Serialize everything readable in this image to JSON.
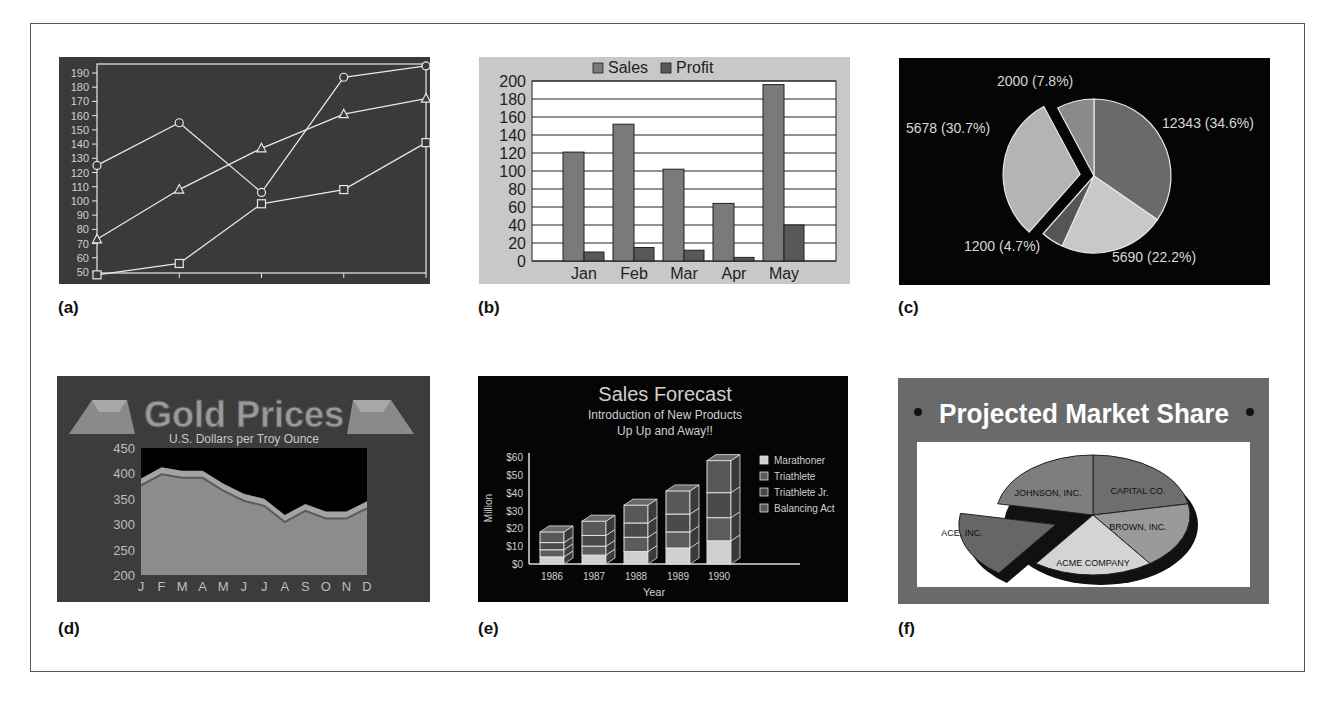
{
  "figure": {
    "panel_labels": [
      "(a)",
      "(b)",
      "(c)",
      "(d)",
      "(e)",
      "(f)"
    ]
  },
  "chart_data": [
    {
      "id": "a",
      "type": "line",
      "title": "",
      "xlabel": "",
      "ylabel": "",
      "x": [
        1,
        2,
        3,
        4,
        5
      ],
      "ylim": [
        50,
        190
      ],
      "yticks": [
        50,
        60,
        70,
        80,
        90,
        100,
        110,
        120,
        130,
        140,
        150,
        160,
        170,
        180,
        190
      ],
      "series": [
        {
          "name": "circle-series",
          "marker": "circle",
          "values": [
            125,
            155,
            106,
            187,
            195
          ]
        },
        {
          "name": "triangle-series",
          "marker": "triangle",
          "values": [
            73,
            108,
            137,
            161,
            172
          ]
        },
        {
          "name": "square-series",
          "marker": "square",
          "values": [
            48,
            56,
            98,
            108,
            141
          ]
        }
      ],
      "grid": false,
      "colors": {
        "background": "#3a3a3a",
        "line": "#e8e8e8"
      }
    },
    {
      "id": "b",
      "type": "bar",
      "title": "",
      "categories": [
        "Jan",
        "Feb",
        "Mar",
        "Apr",
        "May"
      ],
      "series": [
        {
          "name": "Sales",
          "values": [
            121,
            152,
            102,
            64,
            196
          ]
        },
        {
          "name": "Profit",
          "values": [
            10,
            15,
            12,
            4,
            40
          ]
        }
      ],
      "ylim": [
        0,
        200
      ],
      "yticks": [
        0,
        20,
        40,
        60,
        80,
        100,
        120,
        140,
        160,
        180,
        200
      ],
      "legend": [
        "Sales",
        "Profit"
      ],
      "legend_position": "top",
      "grid": true,
      "colors": {
        "background": "#c8c8c8",
        "plot": "#ffffff",
        "sales": "#7a7a7a",
        "profit": "#585858"
      }
    },
    {
      "id": "c",
      "type": "pie",
      "title": "",
      "slices": [
        {
          "value": 12343,
          "label": "12343 (34.6%)",
          "percent": 34.6,
          "color": "#6a6a6a"
        },
        {
          "value": 5690,
          "label": "5690 (22.2%)",
          "percent": 22.2,
          "color": "#c8c8c8"
        },
        {
          "value": 1200,
          "label": "1200 (4.7%)",
          "percent": 4.7,
          "color": "#555555"
        },
        {
          "value": 5678,
          "label": "5678 (30.7%)",
          "percent": 30.7,
          "color": "#b4b4b4",
          "exploded": true
        },
        {
          "value": 2000,
          "label": "2000 (7.8%)",
          "percent": 7.8,
          "color": "#8a8a8a"
        }
      ],
      "colors": {
        "background": "#050505",
        "label": "#d8d8d8"
      }
    },
    {
      "id": "d",
      "type": "area",
      "title": "Gold Prices",
      "subtitle": "U.S. Dollars per Troy Ounce",
      "categories": [
        "J",
        "F",
        "M",
        "A",
        "M",
        "J",
        "J",
        "A",
        "S",
        "O",
        "N",
        "D"
      ],
      "values": [
        390,
        412,
        405,
        405,
        380,
        360,
        350,
        318,
        340,
        325,
        325,
        345
      ],
      "ylim": [
        200,
        450
      ],
      "yticks": [
        200,
        250,
        300,
        350,
        400,
        450
      ],
      "colors": {
        "background": "#3c3c3c",
        "plot": "#000000",
        "area": "#8c8c8c",
        "title": "#9a9a9a"
      }
    },
    {
      "id": "e",
      "type": "bar",
      "stacked": true,
      "title": "Sales Forecast",
      "subtitle": [
        "Introduction of New Products",
        "Up Up and Away!!"
      ],
      "xlabel": "Year",
      "ylabel": "Million",
      "categories": [
        "1986",
        "1987",
        "1988",
        "1989",
        "1990"
      ],
      "series": [
        {
          "name": "Marathoner",
          "values": [
            4,
            5,
            7,
            9,
            13
          ],
          "color": "#d0d0d0"
        },
        {
          "name": "Triathlete",
          "values": [
            4,
            5,
            8,
            9,
            13
          ],
          "color": "#5c5c5c"
        },
        {
          "name": "Triathlete Jr.",
          "values": [
            4,
            6,
            8,
            10,
            14
          ],
          "color": "#4a4a4a"
        },
        {
          "name": "Balancing Act",
          "values": [
            6,
            8,
            10,
            13,
            18
          ],
          "color": "#585858"
        }
      ],
      "ylim": [
        0,
        60
      ],
      "yticks": [
        "$0",
        "$10",
        "$20",
        "$30",
        "$40",
        "$50",
        "$60"
      ],
      "legend_position": "right",
      "colors": {
        "background": "#050505",
        "text": "#cfcfcf"
      }
    },
    {
      "id": "f",
      "type": "pie",
      "title": "Projected Market Share",
      "slices": [
        {
          "label": "CAPITAL CO.",
          "percent": 22,
          "color": "#6e6e6e"
        },
        {
          "label": "BROWN, INC.",
          "percent": 18,
          "color": "#9a9a9a"
        },
        {
          "label": "ACME COMPANY",
          "percent": 20,
          "color": "#d4d4d4"
        },
        {
          "label": "ACE, INC.",
          "percent": 18,
          "color": "#666666",
          "exploded": true
        },
        {
          "label": "JOHNSON, INC.",
          "percent": 22,
          "color": "#7e7e7e"
        }
      ],
      "colors": {
        "background": "#6a6a6a",
        "plot": "#ffffff",
        "title": "#ffffff"
      }
    }
  ]
}
